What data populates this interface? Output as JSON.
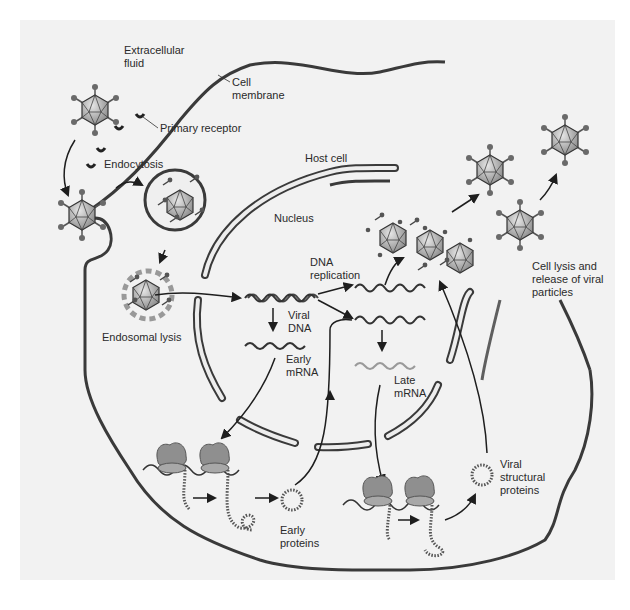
{
  "diagram": {
    "colors": {
      "background": "#f2f2f2",
      "cell_fill": "#f4f4f4",
      "nucleus_fill": "#ececec",
      "membrane": "#3a3a3a",
      "virus_fill": "#b9b9b9",
      "ribosome": "#8f8f8f",
      "late_mrna": "#9a9a9a",
      "arrows": "#1e1e1e"
    },
    "regions": {
      "extracellular": "Extracellular\nfluid",
      "cell_membrane": "Cell\nmembrane",
      "host_cell": "Host cell",
      "nucleus": "Nucleus"
    },
    "steps": {
      "primary_receptor": "Primary receptor",
      "endocytosis": "Endocytosis",
      "endosomal_lysis": "Endosomal lysis",
      "dna_replication": "DNA\nreplication",
      "viral_dna": "Viral\nDNA",
      "early_mrna": "Early\nmRNA",
      "late_mrna": "Late\nmRNA",
      "early_proteins": "Early\nproteins",
      "viral_structural_proteins": "Viral\nstructural\nproteins",
      "cell_lysis": "Cell lysis and\nrelease of viral\nparticles"
    }
  }
}
